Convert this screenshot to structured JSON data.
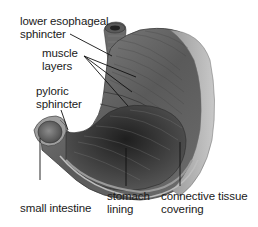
{
  "diagram": {
    "labels": {
      "lower_esophageal_sphincter": "lower esophageal\nsphincter",
      "muscle_layers": "muscle\nlayers",
      "pyloric_sphincter": "pyloric\nsphincter",
      "small_intestine": "small intestine",
      "stomach_lining": "stomach\nlining",
      "connective_tissue_covering": "connective tissue\ncovering"
    },
    "colors": {
      "background": "#ffffff",
      "text": "#1a1a1a",
      "leader_line": "#111111",
      "muscle_dark": "#4a4a4a",
      "muscle_mid": "#7a7a7a",
      "covering_light": "#b8b8b8",
      "lining_dark": "#2e2e2e"
    }
  }
}
